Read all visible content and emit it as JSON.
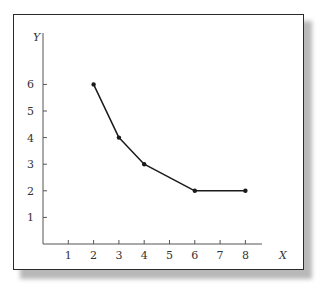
{
  "chart_data": {
    "type": "line",
    "title": "",
    "xlabel": "X",
    "ylabel": "Y",
    "x_ticks": [
      "1",
      "2",
      "3",
      "4",
      "5",
      "6",
      "7",
      "8"
    ],
    "y_ticks": [
      "1",
      "2",
      "3",
      "4",
      "5",
      "6"
    ],
    "xlim": [
      0,
      9
    ],
    "ylim": [
      0,
      7.5
    ],
    "grid": false,
    "legend": null,
    "series": [
      {
        "name": "series-1",
        "x": [
          2,
          3,
          4,
          6,
          8
        ],
        "y": [
          6,
          4,
          3,
          2,
          2
        ],
        "color": "#1a1a1a",
        "marker": "dot"
      }
    ]
  },
  "labels": {
    "x_axis": "X",
    "y_axis": "Y"
  }
}
